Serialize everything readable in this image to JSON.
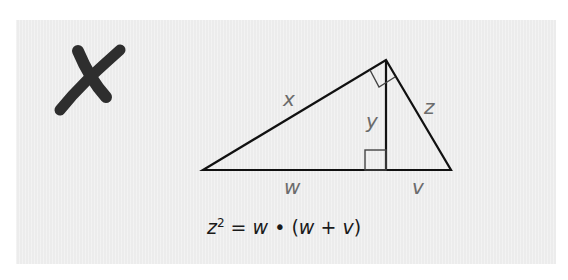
{
  "marker": {
    "icon": "x-mark-icon",
    "color": "#2e2e2e",
    "meaning": "incorrect"
  },
  "diagram": {
    "labels": {
      "hypotenuse_left": "x",
      "altitude": "y",
      "right_side": "z",
      "base_left": "w",
      "base_right": "v"
    },
    "line_color": "#111111",
    "label_color": "#6b6b6b"
  },
  "formula": {
    "lhs_var": "z",
    "exponent": "2",
    "equals": "=",
    "w1": "w",
    "dot": "•",
    "open": "(",
    "w2": "w",
    "plus": "+",
    "v": "v",
    "close": ")"
  }
}
